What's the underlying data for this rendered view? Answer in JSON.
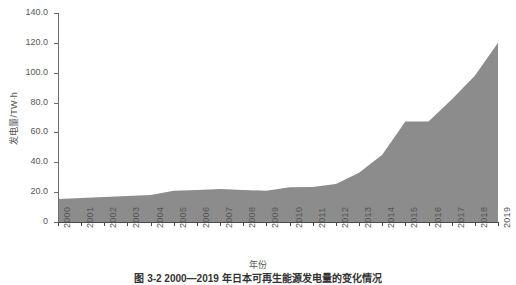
{
  "chart_data": {
    "type": "area",
    "title": "",
    "caption": "图 3-2  2000—2019 年日本可再生能源发电量的变化情况",
    "xlabel": "年份",
    "ylabel": "发电量/TW·h",
    "grid": false,
    "legend": "none",
    "xlim": [
      2000,
      2019
    ],
    "ylim": [
      0,
      140
    ],
    "ytick_labels": [
      "140.0",
      "120.0",
      "100.0",
      "80.0",
      "60.0",
      "40.0",
      "20.0",
      "0"
    ],
    "ytick_values": [
      140,
      120,
      100,
      80,
      60,
      40,
      20,
      0
    ],
    "categories": [
      "2000",
      "2001",
      "2002",
      "2003",
      "2004",
      "2005",
      "2006",
      "2007",
      "2008",
      "2009",
      "2010",
      "2011",
      "2012",
      "2013",
      "2014",
      "2015",
      "2016",
      "2017",
      "2018",
      "2019"
    ],
    "x": [
      2000,
      2001,
      2002,
      2003,
      2004,
      2005,
      2006,
      2007,
      2008,
      2009,
      2010,
      2011,
      2012,
      2013,
      2014,
      2015,
      2016,
      2017,
      2018,
      2019
    ],
    "values": [
      15.4,
      16.1,
      16.8,
      17.4,
      18.1,
      21.0,
      21.4,
      22.1,
      21.4,
      21.0,
      23.2,
      23.4,
      25.5,
      33.0,
      45.0,
      67.3,
      67.3,
      82.0,
      98.0,
      120.0
    ],
    "series": [
      {
        "name": "发电量",
        "color": "#8c8c8c",
        "values": [
          15.4,
          16.1,
          16.8,
          17.4,
          18.1,
          21.0,
          21.4,
          22.1,
          21.4,
          21.0,
          23.2,
          23.4,
          25.5,
          33.0,
          45.0,
          67.3,
          67.3,
          82.0,
          98.0,
          120.0
        ]
      }
    ]
  },
  "colors": {
    "area_fill": "#8c8c8c",
    "axis": "#4a4a4a",
    "text": "#555555",
    "background": "#ffffff"
  }
}
